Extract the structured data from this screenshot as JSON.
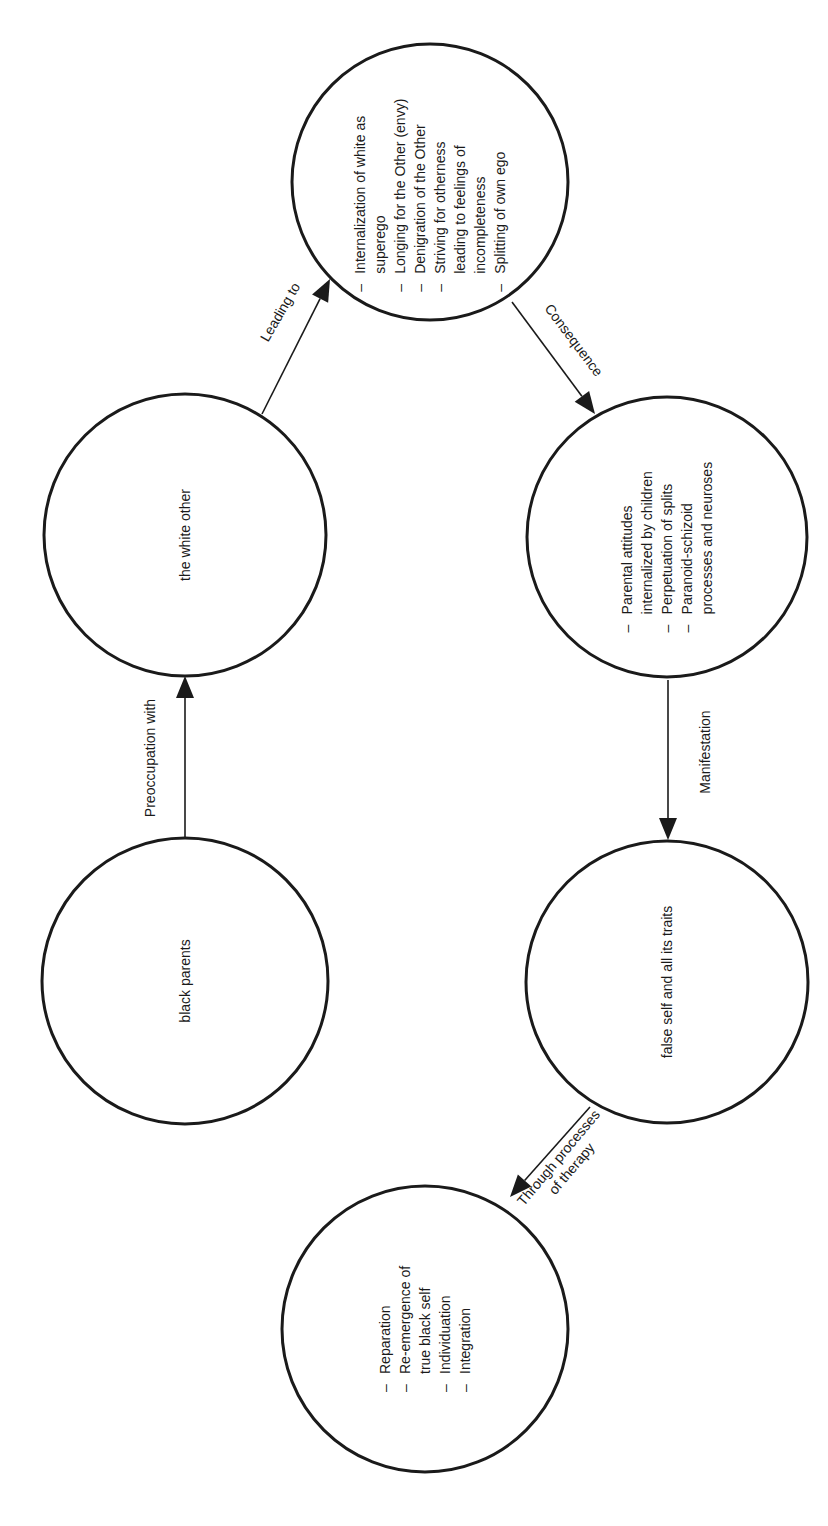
{
  "diagram": {
    "colors": {
      "stroke": "#1a1a1a",
      "background": "#ffffff"
    },
    "nodes": [
      {
        "id": "white-superego",
        "label": "",
        "items": [
          {
            "bullet": true,
            "text": "Internalization of white as"
          },
          {
            "bullet": false,
            "text": "superego"
          },
          {
            "bullet": true,
            "text": "Longing for the Other (envy)"
          },
          {
            "bullet": true,
            "text": "Denigration of the Other"
          },
          {
            "bullet": true,
            "text": "Striving for otherness"
          },
          {
            "bullet": false,
            "text": "leading to feelings of"
          },
          {
            "bullet": false,
            "text": "incompleteness"
          },
          {
            "bullet": true,
            "text": "Splitting of own ego"
          }
        ]
      },
      {
        "id": "white-other",
        "label": "the white other",
        "items": []
      },
      {
        "id": "black-parents",
        "label": "black parents",
        "items": []
      },
      {
        "id": "parental-attitudes",
        "label": "",
        "items": [
          {
            "bullet": true,
            "text": "Parental attitudes"
          },
          {
            "bullet": false,
            "text": "internalized by children"
          },
          {
            "bullet": true,
            "text": "Perpetuation of splits"
          },
          {
            "bullet": true,
            "text": "Paranoid-schizoid"
          },
          {
            "bullet": false,
            "text": "processes and neuroses"
          }
        ]
      },
      {
        "id": "false-self",
        "label": "false self and all its traits",
        "items": []
      },
      {
        "id": "reparation",
        "label": "",
        "items": [
          {
            "bullet": true,
            "text": "Reparation"
          },
          {
            "bullet": true,
            "text": "Re-emergence of"
          },
          {
            "bullet": false,
            "text": "true black self"
          },
          {
            "bullet": true,
            "text": "Individuation"
          },
          {
            "bullet": true,
            "text": "Integration"
          }
        ]
      }
    ],
    "edges": [
      {
        "from": "black-parents",
        "to": "white-other",
        "label": [
          "Preoccupation with"
        ]
      },
      {
        "from": "white-other",
        "to": "white-superego",
        "label": [
          "Leading to"
        ]
      },
      {
        "from": "white-superego",
        "to": "parental-attitudes",
        "label": [
          "Consequence"
        ]
      },
      {
        "from": "parental-attitudes",
        "to": "false-self",
        "label": [
          "Manifestation"
        ]
      },
      {
        "from": "false-self",
        "to": "reparation",
        "label": [
          "Through processes",
          "of therapy"
        ]
      }
    ],
    "bullet_char": "–"
  }
}
